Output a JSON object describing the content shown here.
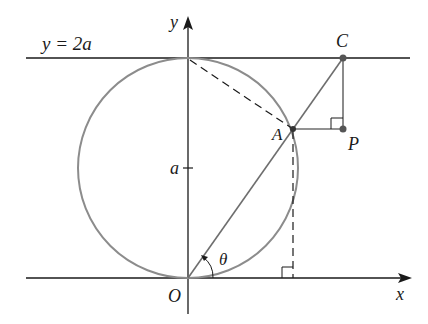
{
  "diagram": {
    "title": "",
    "labels": {
      "line_eq": "y = 2a",
      "y_axis": "y",
      "x_axis": "x",
      "origin": "O",
      "a_tick": "a",
      "point_A": "A",
      "point_C": "C",
      "point_P": "P",
      "angle": "θ"
    },
    "colors": {
      "axis": "#1a1a1a",
      "circle": "#8c8c8c",
      "construction": "#6e6e6e",
      "point": "#555555"
    },
    "elements": [
      "x-axis with arrow",
      "y-axis with arrow",
      "horizontal line y = 2a",
      "circle centered at (0, a) radius a",
      "line from O through A to C",
      "dashed line from (0, 2a) to A",
      "dashed vertical from A to x-axis",
      "segment A to P (horizontal)",
      "segment C to P (vertical)",
      "right-angle markers at P and at foot on x-axis",
      "angle theta at O"
    ]
  }
}
